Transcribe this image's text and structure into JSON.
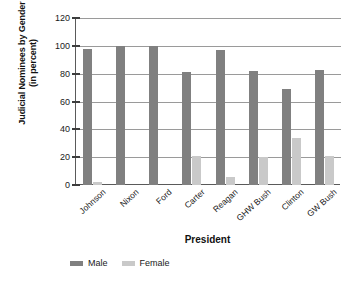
{
  "chart_data": {
    "type": "bar",
    "title": "",
    "subtitle": "",
    "xlabel": "President",
    "ylabel": "Judicial Nominees by Gender (in percent)",
    "ylabel_line1": "Judicial Nominees by Gender",
    "ylabel_line2": "(in percent)",
    "categories": [
      "Johnson",
      "Nixon",
      "Ford",
      "Carter",
      "Reagan",
      "GHW Bush",
      "Clinton",
      "GW Bush"
    ],
    "series": [
      {
        "name": "Male",
        "color": "#808080",
        "values": [
          98,
          100,
          100,
          81,
          97,
          82,
          69,
          83
        ]
      },
      {
        "name": "Female",
        "color": "#c9c9c9",
        "values": [
          2,
          0,
          0,
          21,
          6,
          20,
          34,
          21
        ]
      }
    ],
    "ylim": [
      0,
      120
    ],
    "ytick_labels": [
      "0",
      "20",
      "40",
      "60",
      "80",
      "100",
      "120"
    ],
    "ytick_values": [
      0,
      20,
      40,
      60,
      80,
      100,
      120
    ],
    "grid": true,
    "grid_axis": "y",
    "legend_position": "bottom-left",
    "legend": [
      "Male",
      "Female"
    ],
    "units": "percent"
  }
}
